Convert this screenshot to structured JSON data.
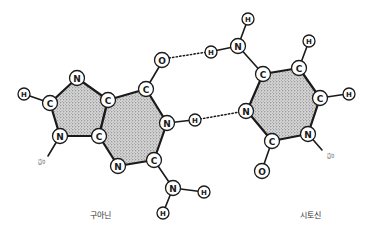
{
  "diagram": {
    "colors": {
      "ink": "#1a1a1a",
      "ring_fill": "#bdbdbd",
      "label": "#333333"
    },
    "molecules": [
      {
        "id": "guanine",
        "caption": "구아닌",
        "sugar_label": "당",
        "atoms": [
          {
            "id": "g_n7",
            "el": "N"
          },
          {
            "id": "g_c8",
            "el": "C"
          },
          {
            "id": "g_h8",
            "el": "H"
          },
          {
            "id": "g_n9",
            "el": "N"
          },
          {
            "id": "g_c4",
            "el": "C"
          },
          {
            "id": "g_c5",
            "el": "C"
          },
          {
            "id": "g_c6",
            "el": "C"
          },
          {
            "id": "g_o6",
            "el": "O"
          },
          {
            "id": "g_n1",
            "el": "N"
          },
          {
            "id": "g_h1",
            "el": "H"
          },
          {
            "id": "g_c2",
            "el": "C"
          },
          {
            "id": "g_n3",
            "el": "N"
          },
          {
            "id": "g_n2",
            "el": "N"
          },
          {
            "id": "g_h2a",
            "el": "H"
          },
          {
            "id": "g_h2b",
            "el": "H"
          }
        ]
      },
      {
        "id": "cytosine",
        "caption": "시토신",
        "sugar_label": "당",
        "atoms": [
          {
            "id": "c_h4a",
            "el": "H"
          },
          {
            "id": "c_n4",
            "el": "N"
          },
          {
            "id": "c_h4b",
            "el": "H"
          },
          {
            "id": "c_c4",
            "el": "C"
          },
          {
            "id": "c_c5",
            "el": "C"
          },
          {
            "id": "c_h5",
            "el": "H"
          },
          {
            "id": "c_c6",
            "el": "C"
          },
          {
            "id": "c_h6",
            "el": "H"
          },
          {
            "id": "c_n1",
            "el": "N"
          },
          {
            "id": "c_c2",
            "el": "C"
          },
          {
            "id": "c_o2",
            "el": "O"
          },
          {
            "id": "c_n3",
            "el": "N"
          }
        ]
      }
    ],
    "hydrogen_bonds": [
      {
        "from": "g_o6",
        "to": "c_h4b"
      },
      {
        "from": "g_h1",
        "to": "c_n3"
      }
    ]
  }
}
